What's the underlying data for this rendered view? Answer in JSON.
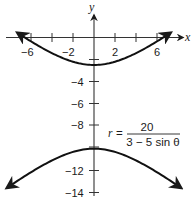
{
  "chart_data": {
    "type": "line",
    "title": "",
    "xlabel": "x",
    "ylabel": "y",
    "xlim": [
      -8.3,
      8.3
    ],
    "ylim": [
      -14,
      3
    ],
    "x_ticks": [
      -6,
      -4,
      -2,
      2,
      4,
      6
    ],
    "x_tick_labels": [
      "-6",
      "-2",
      "2",
      "6"
    ],
    "y_ticks": [
      -2,
      -4,
      -6,
      -8,
      -10,
      -12,
      -14
    ],
    "y_tick_labels": [
      "-4",
      "-6",
      "-8",
      "-12",
      "-14"
    ],
    "grid": false,
    "annotation": {
      "lhs": "r =",
      "numerator": "20",
      "denominator": "3 − 5 sin θ"
    },
    "series": [
      {
        "name": "upper branch",
        "description": "hyperbola branch, vertex (0, -2.5), opens upward",
        "x": [
          -7,
          -6,
          -4,
          -2,
          0,
          2,
          4,
          6,
          7
        ],
        "y": [
          0.2,
          -0.39,
          -1.45,
          -2.21,
          -2.5,
          -2.21,
          -1.45,
          -0.39,
          0.2
        ]
      },
      {
        "name": "lower branch",
        "description": "hyperbola branch, vertex (0, -10), opens downward",
        "x": [
          -8.3,
          -6,
          -4,
          -2,
          0,
          2,
          4,
          6,
          8.3
        ],
        "y": [
          -13.5,
          -12.11,
          -11.05,
          -10.29,
          -10,
          -10.29,
          -11.05,
          -12.11,
          -13.5
        ]
      }
    ]
  },
  "axes": {
    "x_label": "x",
    "y_label": "y",
    "x_tick_text": {
      "neg6": "−6",
      "neg2": "−2",
      "pos2": "2",
      "pos6": "6"
    },
    "y_tick_text": {
      "neg4": "−4",
      "neg6": "−6",
      "neg8": "−8",
      "neg12": "−12",
      "neg14": "−14"
    }
  },
  "formula": {
    "r": "r",
    "equals": "=",
    "numerator": "20",
    "denominator": "3 − 5 sin θ"
  },
  "colors": {
    "ink": "#1a1a1a",
    "background": "#ffffff"
  }
}
